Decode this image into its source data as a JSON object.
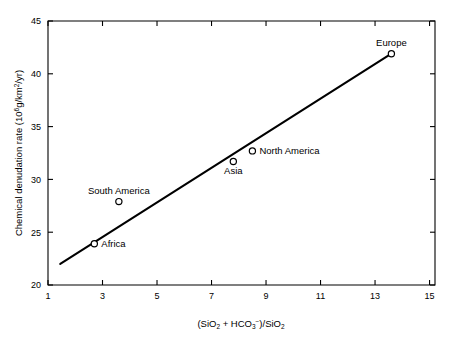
{
  "chart_data": {
    "type": "scatter",
    "title": "",
    "xlabel": "(SiO₂ + HCO₃⁻)/SiO₂",
    "ylabel": "Chemical denudation rate (10⁶g/km²/yr)",
    "xlim": [
      1,
      15.2
    ],
    "ylim": [
      20,
      45
    ],
    "xticks": [
      1,
      3,
      5,
      7,
      9,
      11,
      13,
      15
    ],
    "xtick_labels": [
      "1",
      "3",
      "5",
      "7",
      "9",
      "11",
      "13",
      "15"
    ],
    "yticks": [
      20,
      25,
      30,
      35,
      40,
      45
    ],
    "ytick_labels": [
      "20",
      "25",
      "30",
      "35",
      "40",
      "45"
    ],
    "grid": false,
    "legend": "none",
    "marker_style": "open-circle",
    "points": [
      {
        "label": "Africa",
        "x": 2.7,
        "y": 23.9,
        "label_pos": "right"
      },
      {
        "label": "South America",
        "x": 3.6,
        "y": 27.9,
        "label_pos": "above"
      },
      {
        "label": "Asia",
        "x": 7.8,
        "y": 31.7,
        "label_pos": "below"
      },
      {
        "label": "North America",
        "x": 8.5,
        "y": 32.7,
        "label_pos": "right"
      },
      {
        "label": "Europe",
        "x": 13.6,
        "y": 41.9,
        "label_pos": "above"
      }
    ],
    "series": [
      {
        "name": "trend-line",
        "type": "line",
        "x": [
          1.45,
          13.6
        ],
        "values": [
          22.0,
          41.9
        ]
      }
    ]
  },
  "axis": {
    "x_label_main": "(SiO",
    "x_label_sub1": "2",
    "x_label_mid": " + HCO",
    "x_label_sub2": "3",
    "x_label_sup": "−",
    "x_label_close": ")/SiO",
    "x_label_sub3": "2",
    "y_label_main": "Chemical denudation rate (10",
    "y_label_sup1": "6",
    "y_label_mid": "g/km",
    "y_label_sup2": "2",
    "y_label_end": "/yr)"
  },
  "colors": {
    "axis": "#000000",
    "line": "#000000",
    "marker_fill": "#ffffff",
    "background": "#ffffff"
  }
}
